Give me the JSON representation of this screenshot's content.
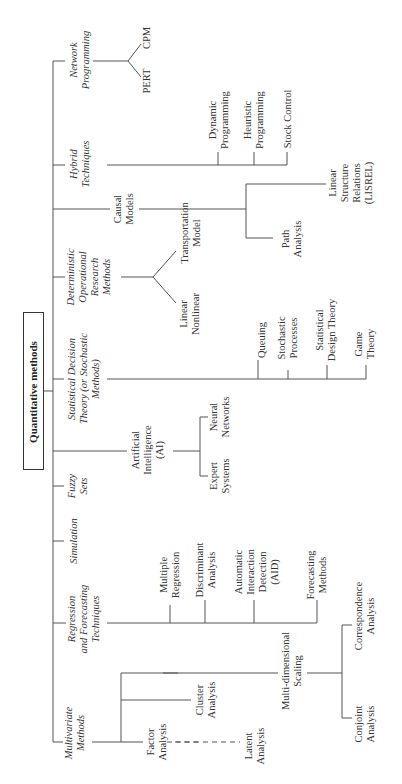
{
  "root": {
    "label": "Quantitative methods"
  },
  "categories": [
    {
      "id": "multivariate",
      "label": "Multivariate\nMethods",
      "children": [
        "Factor\nAnalysis",
        "Cluster\nAnalysis",
        "Multi-dimensional\nScaling",
        "Latent\nAnalysis",
        "Correspondence\nAnalysis",
        "Conjoint\nAnalysis"
      ]
    },
    {
      "id": "regression",
      "label": "Regression\nand Forecasting\nTechniques",
      "children": [
        "Multiple\nRegression",
        "Discriminant\nAnalysis",
        "Automatic\nInteraction\nDetection\n(AID)",
        "Forecasting\nMethods"
      ]
    },
    {
      "id": "simulation",
      "label": "Simulation",
      "children": []
    },
    {
      "id": "fuzzy",
      "label": "Fuzzy\nSets",
      "children": []
    },
    {
      "id": "ai",
      "label": "Artificial\nIntelligence\n(AI)",
      "children": [
        "Expert\nSystems",
        "Neural\nNetworks"
      ]
    },
    {
      "id": "statistical",
      "label": "Statistical Decision\nTheory (or Stochastic\nMethods)",
      "children": [
        "Queuing",
        "Stochastic\nProcesses",
        "Statistical\nDesign Theory",
        "Game\nTheory"
      ]
    },
    {
      "id": "deterministic",
      "label": "Deterministic\nOperational\nResearch\nMethods",
      "children": [
        "Linear\nNonlinear",
        "Transportation\nModel"
      ]
    },
    {
      "id": "causal",
      "label": "Causal\nModels",
      "children": [
        "Path\nAnalysis",
        "Linear\nStructure\nRelations\n(LISREL)"
      ]
    },
    {
      "id": "hybrid",
      "label": "Hybrid\nTechniques",
      "children": [
        "Dynamic\nProgramming",
        "Heuristic\nProgramming",
        "Stock Control"
      ]
    },
    {
      "id": "network",
      "label": "Network\nProgramming",
      "children": [
        "PERT",
        "CPM"
      ]
    }
  ],
  "legend": {
    "dashed_link": "Factor Analysis — Latent Analysis (dashed)"
  },
  "colors": {
    "line": "#555555",
    "text": "#333333",
    "background": "#ffffff"
  }
}
